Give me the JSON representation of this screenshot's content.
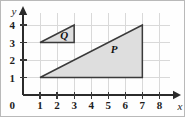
{
  "chart_data": {
    "type": "scatter",
    "title": "",
    "xlabel": "x",
    "ylabel": "y",
    "xlim": [
      0,
      8.6
    ],
    "ylim": [
      0,
      4.7
    ],
    "grid": true,
    "legend": false,
    "xticks": [
      0,
      1,
      2,
      3,
      4,
      5,
      6,
      7,
      8
    ],
    "xtick_labels": [
      "0",
      "1",
      "2",
      "3",
      "4",
      "5",
      "6",
      "7",
      "8"
    ],
    "yticks": [
      0,
      1,
      2,
      3,
      4
    ],
    "ytick_labels": [
      "0",
      "1",
      "2",
      "3",
      "4"
    ],
    "origin_label": "0",
    "shapes": [
      {
        "name": "P",
        "label": "P",
        "kind": "triangle",
        "vertices": [
          [
            1,
            1
          ],
          [
            7,
            1
          ],
          [
            7,
            4
          ]
        ],
        "label_at": [
          5.35,
          2.55
        ],
        "fill": "#dedede",
        "stroke": "#3a3a3a"
      },
      {
        "name": "Q",
        "label": "Q",
        "kind": "triangle",
        "vertices": [
          [
            1,
            3
          ],
          [
            3,
            3
          ],
          [
            3,
            4
          ]
        ],
        "label_at": [
          2.42,
          3.32
        ],
        "fill": "#dedede",
        "stroke": "#3a3a3a"
      }
    ],
    "colors": {
      "grid": "#d9d9d9",
      "axis": "#2b2b2b",
      "shape_fill": "#dedede",
      "shape_stroke": "#3a3a3a",
      "text": "#1d1d1d",
      "background": "#fefefe"
    }
  }
}
